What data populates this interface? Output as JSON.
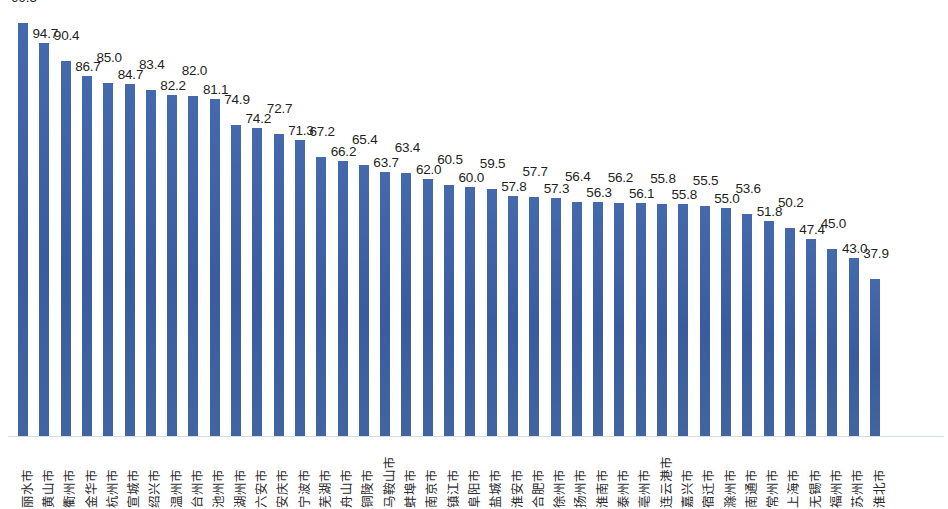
{
  "chart_data": {
    "type": "bar",
    "title": "",
    "subtitle": "",
    "xlabel": "",
    "ylabel": "",
    "ylim": [
      0,
      99.5
    ],
    "grid": false,
    "legend": null,
    "bar_color": "#3f63a4",
    "axis_color": "#d6dce6",
    "label_color": "#231f20",
    "categories": [
      "丽水市",
      "黄山市",
      "衢州市",
      "金华市",
      "杭州市",
      "宣城市",
      "绍兴市",
      "温州市",
      "台州市",
      "池州市",
      "湖州市",
      "六安市",
      "安庆市",
      "宁波市",
      "芜湖市",
      "舟山市",
      "铜陵市",
      "马鞍山市",
      "蚌埠市",
      "南京市",
      "镇江市",
      "阜阳市",
      "盐城市",
      "淮安市",
      "合肥市",
      "徐州市",
      "扬州市",
      "淮南市",
      "泰州市",
      "亳州市",
      "连云港市",
      "嘉兴市",
      "宿迁市",
      "滁州市",
      "南通市",
      "常州市",
      "上海市",
      "无锡市",
      "福州市",
      "苏州市",
      "淮北市"
    ],
    "values": [
      99.5,
      94.7,
      90.4,
      86.7,
      85.0,
      84.7,
      83.4,
      82.2,
      82.0,
      81.1,
      74.9,
      74.2,
      72.7,
      71.3,
      67.2,
      66.2,
      65.4,
      63.7,
      63.4,
      62.0,
      60.5,
      60.0,
      59.5,
      57.8,
      57.7,
      57.3,
      56.4,
      56.3,
      56.2,
      56.1,
      55.8,
      55.8,
      55.5,
      55.0,
      53.6,
      51.8,
      50.2,
      47.4,
      45.0,
      43.0,
      37.9
    ],
    "value_labels": [
      "99.5",
      "94.7",
      "90.4",
      "86.7",
      "85.0",
      "84.7",
      "83.4",
      "82.2",
      "82.0",
      "81.1",
      "74.9",
      "74.2",
      "72.7",
      "71.3",
      "67.2",
      "66.2",
      "65.4",
      "63.7",
      "63.4",
      "62.0",
      "60.5",
      "60.0",
      "59.5",
      "57.8",
      "57.7",
      "57.3",
      "56.4",
      "56.3",
      "56.2",
      "56.1",
      "55.8",
      "55.8",
      "55.5",
      "55.0",
      "53.6",
      "51.8",
      "50.2",
      "47.4",
      "45.0",
      "43.0",
      "37.9"
    ]
  }
}
